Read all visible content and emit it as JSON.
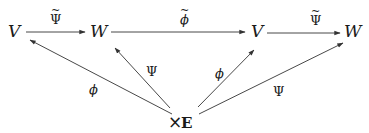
{
  "diagram": {
    "nodes": {
      "v1": "V",
      "w1": "W",
      "v2": "V",
      "w2": "W",
      "times": "×",
      "e": "E"
    },
    "edges": {
      "v1_w1": {
        "label": "Ψ",
        "tilde": "~"
      },
      "w1_v2": {
        "label": "ϕ",
        "tilde": "~"
      },
      "v2_w2": {
        "label": "Ψ",
        "tilde": "~"
      },
      "e_v1": {
        "label": "ϕ"
      },
      "e_w1": {
        "label": "Ψ"
      },
      "e_v2": {
        "label": "ϕ"
      },
      "e_w2": {
        "label": "Ψ"
      }
    },
    "colors": {
      "ink": "#1a1a1a",
      "edge": "#333333",
      "background": "#ffffff"
    }
  }
}
